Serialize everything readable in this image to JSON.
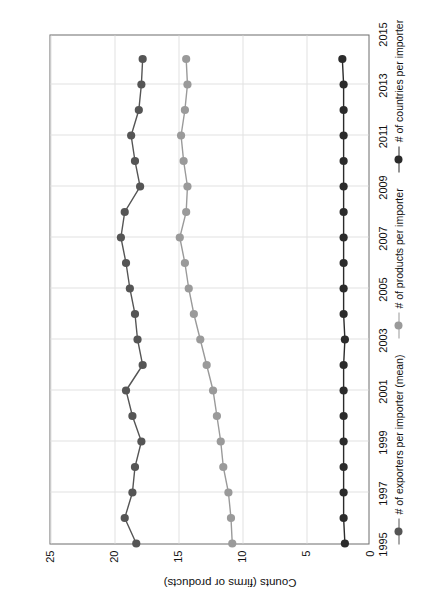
{
  "chart_data": {
    "type": "line",
    "title": "",
    "subtitle": "",
    "xlabel": "",
    "ylabel": "Counts (firms or products)",
    "grid": true,
    "legend_position": "bottom",
    "orientation_note": "figure rendered rotated 90 degrees counter-clockwise on the page",
    "xlim": [
      1995,
      2015
    ],
    "ylim": [
      0,
      25
    ],
    "xticks": [
      "1995",
      "1997",
      "1999",
      "2001",
      "2003",
      "2005",
      "2007",
      "2009",
      "2011",
      "2013",
      "2015"
    ],
    "yticks": [
      "0",
      "5",
      "10",
      "15",
      "20",
      "25"
    ],
    "x": [
      1995,
      1996,
      1997,
      1998,
      1999,
      2000,
      2001,
      2002,
      2003,
      2004,
      2005,
      2006,
      2007,
      2008,
      2009,
      2010,
      2011,
      2012,
      2013,
      2014
    ],
    "series": [
      {
        "name": "# of exporters per importer (mean)",
        "color": "#555555",
        "marker": "circle",
        "values": [
          18.3,
          19.2,
          18.6,
          18.4,
          17.9,
          18.6,
          19.1,
          17.8,
          18.2,
          18.4,
          18.8,
          19.1,
          19.5,
          19.2,
          18.0,
          18.4,
          18.7,
          18.1,
          17.9,
          17.8
        ]
      },
      {
        "name": "# of products per importer",
        "color": "#9a9a9a",
        "marker": "circle",
        "values": [
          10.8,
          10.9,
          11.1,
          11.5,
          11.7,
          12.0,
          12.3,
          12.8,
          13.3,
          13.8,
          14.2,
          14.5,
          14.9,
          14.4,
          14.3,
          14.6,
          14.8,
          14.5,
          14.3,
          14.4
        ]
      },
      {
        "name": "# of countries per importer",
        "color": "#2b2b2b",
        "marker": "circle",
        "values": [
          2.0,
          2.1,
          2.1,
          2.1,
          2.1,
          2.1,
          2.1,
          2.1,
          2.0,
          2.1,
          2.1,
          2.1,
          2.1,
          2.1,
          2.1,
          2.1,
          2.1,
          2.1,
          2.1,
          2.2
        ]
      }
    ]
  },
  "axis": {
    "y_label": "Counts (firms or products)"
  },
  "legend": {
    "entries": [
      {
        "label": "# of exporters per importer (mean)",
        "color": "#555555"
      },
      {
        "label": "# of products per importer",
        "color": "#9a9a9a"
      },
      {
        "label": "# of countries per importer",
        "color": "#2b2b2b"
      }
    ]
  },
  "colors": {
    "frame": "#6d6d6d",
    "grid": "#e2e2e2",
    "background": "#ffffff",
    "text": "#111111"
  }
}
